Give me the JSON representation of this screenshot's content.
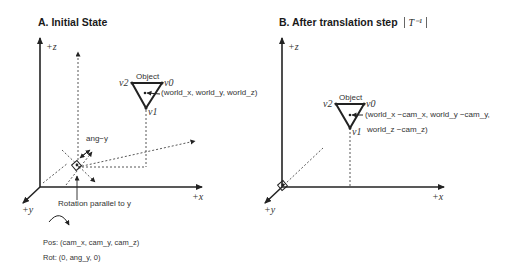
{
  "panel_a": {
    "title": "A. Initial State",
    "axes": {
      "z": "+z",
      "x": "+x",
      "y": "+y"
    },
    "object": {
      "label": "Object",
      "v0": "v0",
      "v1": "v1",
      "v2": "v2",
      "position": "(world_x, world_y, world_z)"
    },
    "camera": {
      "angle_label": "ang−y",
      "rotation_note": "Rotation parallel to y",
      "pos": "Pos: (cam_x, cam_y, cam_z)",
      "rot": "Rot: (0, ang_y, 0)"
    }
  },
  "panel_b": {
    "title": "B. After translation step",
    "step_symbol": "T⁻¹",
    "axes": {
      "z": "+z",
      "x": "+x",
      "y": "+y"
    },
    "object": {
      "label": "Object",
      "v0": "v0",
      "v1": "v1",
      "v2": "v2",
      "position_line1": "(world_x −cam_x, world_y −cam_y,",
      "position_line2": "world_z −cam_z)"
    }
  }
}
